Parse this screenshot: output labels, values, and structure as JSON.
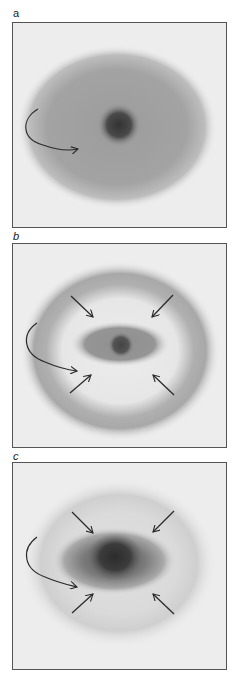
{
  "figure": {
    "panels": [
      {
        "label": "a",
        "description": "Broad diffuse elliptical cloud with dark central core; curved arrow indicates rotation",
        "arrows": {
          "curved": 1,
          "inward": 0
        }
      },
      {
        "label": "b",
        "description": "Outer ring with central elongated bar and dark core; four inward arrows plus curved rotation arrow",
        "arrows": {
          "curved": 1,
          "inward": 4
        }
      },
      {
        "label": "c",
        "description": "Faint outer halo with dense elongated dark central concentration; four inward arrows plus curved rotation arrow",
        "arrows": {
          "curved": 1,
          "inward": 4
        }
      }
    ],
    "colors": {
      "background": "#ededed",
      "border": "#555555",
      "arrow": "#2b2b2b",
      "core": "#333333",
      "cloud": "#9e9e9e"
    }
  }
}
